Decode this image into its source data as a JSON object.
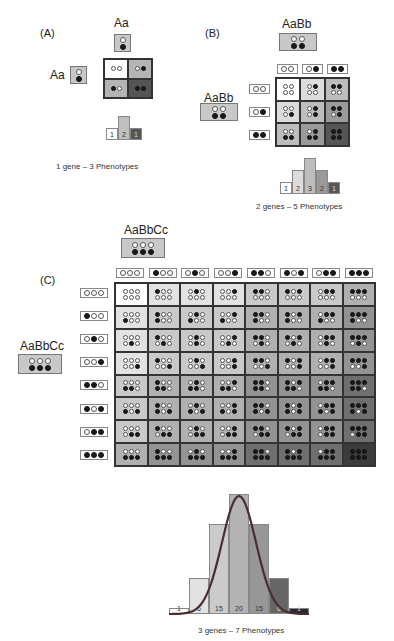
{
  "panelA": {
    "label": "(A)",
    "parent_top": {
      "genotype": "Aa",
      "alleles": [
        [
          "w"
        ],
        [
          "b"
        ]
      ]
    },
    "parent_left": {
      "genotype": "Aa",
      "alleles": [
        [
          "w"
        ],
        [
          "b"
        ]
      ]
    },
    "cells": [
      {
        "dots": "ww",
        "shade": "#ffffff"
      },
      {
        "dots": "wb",
        "shade": "#b4b4b4"
      },
      {
        "dots": "bw",
        "shade": "#b4b4b4"
      },
      {
        "dots": "bb",
        "shade": "#555555"
      }
    ],
    "histogram": [
      {
        "label": "1",
        "count": 1,
        "color": "#ffffff"
      },
      {
        "label": "2",
        "count": 2,
        "color": "#c0c0c0"
      },
      {
        "label": "1",
        "count": 1,
        "color": "#555555"
      }
    ],
    "caption": "1 gene – 3 Phenotypes"
  },
  "panelB": {
    "label": "(B)",
    "parent_top": {
      "genotype": "AaBb",
      "alleles": [
        [
          "w",
          "w"
        ],
        [
          "b",
          "b"
        ]
      ]
    },
    "parent_left": {
      "genotype": "AaBb",
      "alleles": [
        [
          "w",
          "w"
        ],
        [
          "b",
          "b"
        ]
      ]
    },
    "gametes": [
      "ww",
      "wb",
      "bb"
    ],
    "histogram": [
      {
        "label": "1",
        "count": 1,
        "color": "#ffffff"
      },
      {
        "label": "2",
        "count": 2,
        "color": "#dcdcdc"
      },
      {
        "label": "3",
        "count": 3,
        "color": "#bdbdbd"
      },
      {
        "label": "2",
        "count": 2,
        "color": "#9a9a9a"
      },
      {
        "label": "1",
        "count": 1,
        "color": "#555555"
      }
    ],
    "caption": "2 genes – 5 Phenotypes"
  },
  "panelC": {
    "label": "(C)",
    "parent_top": {
      "genotype": "AaBbCc",
      "alleles": [
        [
          "w",
          "w",
          "w"
        ],
        [
          "b",
          "b",
          "b"
        ]
      ]
    },
    "parent_left": {
      "genotype": "AaBbCc",
      "alleles": [
        [
          "w",
          "w",
          "w"
        ],
        [
          "b",
          "b",
          "b"
        ]
      ]
    },
    "gametes": [
      "www",
      "bww",
      "wbw",
      "wwb",
      "bbw",
      "bwb",
      "wbb",
      "bbb"
    ],
    "shades": [
      "#ffffff",
      "#e2e2e2",
      "#c9c9c9",
      "#b0b0b0",
      "#939393",
      "#6f6f6f",
      "#3c3c3c"
    ],
    "histogram": [
      {
        "label": "1",
        "count": 1,
        "color": "#ffffff"
      },
      {
        "label": "6",
        "count": 6,
        "color": "#e2e2e2"
      },
      {
        "label": "15",
        "count": 15,
        "color": "#cbcbcb"
      },
      {
        "label": "20",
        "count": 20,
        "color": "#b3b3b3"
      },
      {
        "label": "15",
        "count": 15,
        "color": "#979797"
      },
      {
        "label": "6",
        "count": 6,
        "color": "#666666"
      },
      {
        "label": "1",
        "count": 1,
        "color": "#2a2a2a"
      }
    ],
    "curve_color": "#4a2e2e",
    "caption": "3 genes – 7 Phenotypes"
  },
  "chart_data": [
    {
      "type": "bar",
      "title": "1 gene – 3 Phenotypes",
      "categories": [
        "1",
        "2",
        "3"
      ],
      "values": [
        1,
        2,
        1
      ]
    },
    {
      "type": "bar",
      "title": "2 genes – 5 Phenotypes",
      "categories": [
        "1",
        "2",
        "3",
        "4",
        "5"
      ],
      "values": [
        1,
        2,
        3,
        2,
        1
      ]
    },
    {
      "type": "bar",
      "title": "3 genes – 7 Phenotypes",
      "categories": [
        "1",
        "2",
        "3",
        "4",
        "5",
        "6",
        "7"
      ],
      "values": [
        1,
        6,
        15,
        20,
        15,
        6,
        1
      ],
      "overlay": "normal curve"
    }
  ]
}
